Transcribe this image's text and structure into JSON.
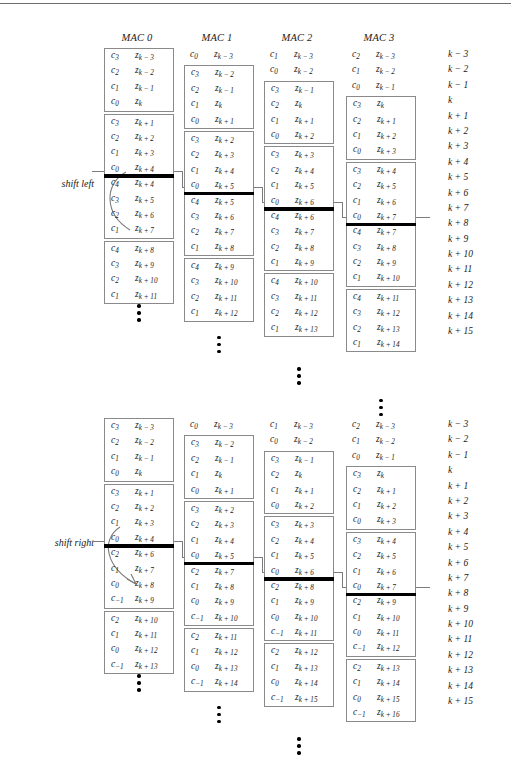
{
  "page": {
    "running_head": "",
    "rule_color": "#6d6d6d"
  },
  "headers": [
    {
      "label": "MAC 0"
    },
    {
      "label": "MAC 1"
    },
    {
      "label": "MAC 2"
    },
    {
      "label": "MAC 3"
    }
  ],
  "shift_left": {
    "label": "shift left",
    "index_column": [
      "k − 3",
      "k − 2",
      "k − 1",
      "k",
      "k + 1",
      "k + 2",
      "k + 3",
      "k + 4",
      "k + 5",
      "k + 6",
      "k + 7",
      "k + 8",
      "k + 9",
      "k + 10",
      "k + 11",
      "k + 12",
      "k + 13",
      "k + 14",
      "k + 15"
    ],
    "columns": [
      {
        "name": "MAC 0",
        "offset_rows": 0,
        "groups": [
          {
            "boxed": true,
            "rows": [
              {
                "c": "3",
                "z": "k − 3"
              },
              {
                "c": "2",
                "z": "k − 2"
              },
              {
                "c": "1",
                "z": "k − 1"
              },
              {
                "c": "0",
                "z": "k"
              }
            ]
          },
          {
            "boxed": true,
            "bar_after": 4,
            "rows": [
              {
                "c": "3",
                "z": "k + 1"
              },
              {
                "c": "2",
                "z": "k + 2"
              },
              {
                "c": "1",
                "z": "k + 3"
              },
              {
                "c": "0",
                "z": "k + 4"
              },
              {
                "c": "4",
                "z": "k + 4"
              },
              {
                "c": "3",
                "z": "k + 5"
              },
              {
                "c": "2",
                "z": "k + 6"
              },
              {
                "c": "1",
                "z": "k + 7"
              }
            ]
          },
          {
            "boxed": true,
            "rows": [
              {
                "c": "4",
                "z": "k + 8"
              },
              {
                "c": "3",
                "z": "k + 9"
              },
              {
                "c": "2",
                "z": "k + 10"
              },
              {
                "c": "1",
                "z": "k + 11"
              }
            ]
          }
        ]
      },
      {
        "name": "MAC 1",
        "offset_rows": 0,
        "groups": [
          {
            "boxed": false,
            "rows": [
              {
                "c": "0",
                "z": "k − 3"
              }
            ]
          },
          {
            "boxed": true,
            "rows": [
              {
                "c": "3",
                "z": "k − 2"
              },
              {
                "c": "2",
                "z": "k − 1"
              },
              {
                "c": "1",
                "z": "k"
              },
              {
                "c": "0",
                "z": "k + 1"
              }
            ]
          },
          {
            "boxed": true,
            "bar_after": 4,
            "rows": [
              {
                "c": "3",
                "z": "k + 2"
              },
              {
                "c": "2",
                "z": "k + 3"
              },
              {
                "c": "1",
                "z": "k + 4"
              },
              {
                "c": "0",
                "z": "k + 5"
              },
              {
                "c": "4",
                "z": "k + 5"
              },
              {
                "c": "3",
                "z": "k + 6"
              },
              {
                "c": "2",
                "z": "k + 7"
              },
              {
                "c": "1",
                "z": "k + 8"
              }
            ]
          },
          {
            "boxed": true,
            "rows": [
              {
                "c": "4",
                "z": "k + 9"
              },
              {
                "c": "3",
                "z": "k + 10"
              },
              {
                "c": "2",
                "z": "k + 11"
              },
              {
                "c": "1",
                "z": "k + 12"
              }
            ]
          }
        ]
      },
      {
        "name": "MAC 2",
        "offset_rows": 0,
        "groups": [
          {
            "boxed": false,
            "rows": [
              {
                "c": "1",
                "z": "k − 3"
              },
              {
                "c": "0",
                "z": "k − 2"
              }
            ]
          },
          {
            "boxed": true,
            "rows": [
              {
                "c": "3",
                "z": "k − 1"
              },
              {
                "c": "2",
                "z": "k"
              },
              {
                "c": "1",
                "z": "k + 1"
              },
              {
                "c": "0",
                "z": "k + 2"
              }
            ]
          },
          {
            "boxed": true,
            "bar_after": 4,
            "rows": [
              {
                "c": "3",
                "z": "k + 3"
              },
              {
                "c": "2",
                "z": "k + 4"
              },
              {
                "c": "1",
                "z": "k + 5"
              },
              {
                "c": "0",
                "z": "k + 6"
              },
              {
                "c": "4",
                "z": "k + 6"
              },
              {
                "c": "3",
                "z": "k + 7"
              },
              {
                "c": "2",
                "z": "k + 8"
              },
              {
                "c": "1",
                "z": "k + 9"
              }
            ]
          },
          {
            "boxed": true,
            "rows": [
              {
                "c": "4",
                "z": "k + 10"
              },
              {
                "c": "3",
                "z": "k + 11"
              },
              {
                "c": "2",
                "z": "k + 12"
              },
              {
                "c": "1",
                "z": "k + 13"
              }
            ]
          }
        ]
      },
      {
        "name": "MAC 3",
        "offset_rows": 0,
        "groups": [
          {
            "boxed": false,
            "rows": [
              {
                "c": "2",
                "z": "k − 3"
              },
              {
                "c": "1",
                "z": "k − 2"
              },
              {
                "c": "0",
                "z": "k − 1"
              }
            ]
          },
          {
            "boxed": true,
            "rows": [
              {
                "c": "3",
                "z": "k"
              },
              {
                "c": "2",
                "z": "k + 1"
              },
              {
                "c": "1",
                "z": "k + 2"
              },
              {
                "c": "0",
                "z": "k + 3"
              }
            ]
          },
          {
            "boxed": true,
            "bar_after": 4,
            "rows": [
              {
                "c": "3",
                "z": "k + 4"
              },
              {
                "c": "2",
                "z": "k + 5"
              },
              {
                "c": "1",
                "z": "k + 6"
              },
              {
                "c": "0",
                "z": "k + 7"
              },
              {
                "c": "4",
                "z": "k + 7"
              },
              {
                "c": "3",
                "z": "k + 8"
              },
              {
                "c": "2",
                "z": "k + 9"
              },
              {
                "c": "1",
                "z": "k + 10"
              }
            ]
          },
          {
            "boxed": true,
            "rows": [
              {
                "c": "4",
                "z": "k + 11"
              },
              {
                "c": "3",
                "z": "k + 12"
              },
              {
                "c": "2",
                "z": "k + 13"
              },
              {
                "c": "1",
                "z": "k + 14"
              }
            ]
          }
        ]
      }
    ]
  },
  "shift_right": {
    "label": "shift right",
    "index_column": [
      "k − 3",
      "k − 2",
      "k − 1",
      "k",
      "k + 1",
      "k + 2",
      "k + 3",
      "k + 4",
      "k + 5",
      "k + 6",
      "k + 7",
      "k + 8",
      "k + 9",
      "k + 10",
      "k + 11",
      "k + 12",
      "k + 13",
      "k + 14",
      "k + 15"
    ],
    "columns": [
      {
        "name": "MAC 0",
        "offset_rows": 0,
        "groups": [
          {
            "boxed": true,
            "rows": [
              {
                "c": "3",
                "z": "k − 3"
              },
              {
                "c": "2",
                "z": "k − 2"
              },
              {
                "c": "1",
                "z": "k − 1"
              },
              {
                "c": "0",
                "z": "k"
              }
            ]
          },
          {
            "boxed": true,
            "bar_after": 4,
            "rows": [
              {
                "c": "3",
                "z": "k + 1"
              },
              {
                "c": "2",
                "z": "k + 2"
              },
              {
                "c": "1",
                "z": "k + 3"
              },
              {
                "c": "0",
                "z": "k + 4"
              },
              {
                "c": "2",
                "z": "k + 6"
              },
              {
                "c": "1",
                "z": "k + 7"
              },
              {
                "c": "0",
                "z": "k + 8"
              },
              {
                "c": "−1",
                "z": "k + 9"
              }
            ]
          },
          {
            "boxed": true,
            "rows": [
              {
                "c": "2",
                "z": "k + 10"
              },
              {
                "c": "1",
                "z": "k + 11"
              },
              {
                "c": "0",
                "z": "k + 12"
              },
              {
                "c": "−1",
                "z": "k + 13"
              }
            ]
          }
        ]
      },
      {
        "name": "MAC 1",
        "offset_rows": 0,
        "groups": [
          {
            "boxed": false,
            "rows": [
              {
                "c": "0",
                "z": "k − 3"
              }
            ]
          },
          {
            "boxed": true,
            "rows": [
              {
                "c": "3",
                "z": "k − 2"
              },
              {
                "c": "2",
                "z": "k − 1"
              },
              {
                "c": "1",
                "z": "k"
              },
              {
                "c": "0",
                "z": "k + 1"
              }
            ]
          },
          {
            "boxed": true,
            "bar_after": 4,
            "rows": [
              {
                "c": "3",
                "z": "k + 2"
              },
              {
                "c": "2",
                "z": "k + 3"
              },
              {
                "c": "1",
                "z": "k + 4"
              },
              {
                "c": "0",
                "z": "k + 5"
              },
              {
                "c": "2",
                "z": "k + 7"
              },
              {
                "c": "1",
                "z": "k + 8"
              },
              {
                "c": "0",
                "z": "k + 9"
              },
              {
                "c": "−1",
                "z": "k + 10"
              }
            ]
          },
          {
            "boxed": true,
            "rows": [
              {
                "c": "2",
                "z": "k + 11"
              },
              {
                "c": "1",
                "z": "k + 12"
              },
              {
                "c": "0",
                "z": "k + 13"
              },
              {
                "c": "−1",
                "z": "k + 14"
              }
            ]
          }
        ]
      },
      {
        "name": "MAC 2",
        "offset_rows": 0,
        "groups": [
          {
            "boxed": false,
            "rows": [
              {
                "c": "1",
                "z": "k − 3"
              },
              {
                "c": "0",
                "z": "k − 2"
              }
            ]
          },
          {
            "boxed": true,
            "rows": [
              {
                "c": "3",
                "z": "k − 1"
              },
              {
                "c": "2",
                "z": "k"
              },
              {
                "c": "1",
                "z": "k + 1"
              },
              {
                "c": "0",
                "z": "k + 2"
              }
            ]
          },
          {
            "boxed": true,
            "bar_after": 4,
            "rows": [
              {
                "c": "3",
                "z": "k + 3"
              },
              {
                "c": "2",
                "z": "k + 4"
              },
              {
                "c": "1",
                "z": "k + 5"
              },
              {
                "c": "0",
                "z": "k + 6"
              },
              {
                "c": "2",
                "z": "k + 8"
              },
              {
                "c": "1",
                "z": "k + 9"
              },
              {
                "c": "0",
                "z": "k + 10"
              },
              {
                "c": "−1",
                "z": "k + 11"
              }
            ]
          },
          {
            "boxed": true,
            "rows": [
              {
                "c": "2",
                "z": "k + 12"
              },
              {
                "c": "1",
                "z": "k + 13"
              },
              {
                "c": "0",
                "z": "k + 14"
              },
              {
                "c": "−1",
                "z": "k + 15"
              }
            ]
          }
        ]
      },
      {
        "name": "MAC 3",
        "offset_rows": 0,
        "groups": [
          {
            "boxed": false,
            "rows": [
              {
                "c": "2",
                "z": "k − 3"
              },
              {
                "c": "1",
                "z": "k − 2"
              },
              {
                "c": "0",
                "z": "k − 1"
              }
            ]
          },
          {
            "boxed": true,
            "rows": [
              {
                "c": "3",
                "z": "k"
              },
              {
                "c": "2",
                "z": "k + 1"
              },
              {
                "c": "1",
                "z": "k + 2"
              },
              {
                "c": "0",
                "z": "k + 3"
              }
            ]
          },
          {
            "boxed": true,
            "bar_after": 4,
            "rows": [
              {
                "c": "3",
                "z": "k + 4"
              },
              {
                "c": "2",
                "z": "k + 5"
              },
              {
                "c": "1",
                "z": "k + 6"
              },
              {
                "c": "0",
                "z": "k + 7"
              },
              {
                "c": "2",
                "z": "k + 9"
              },
              {
                "c": "1",
                "z": "k + 10"
              },
              {
                "c": "0",
                "z": "k + 11"
              },
              {
                "c": "−1",
                "z": "k + 12"
              }
            ]
          },
          {
            "boxed": true,
            "rows": [
              {
                "c": "2",
                "z": "k + 13"
              },
              {
                "c": "1",
                "z": "k + 14"
              },
              {
                "c": "0",
                "z": "k + 15"
              },
              {
                "c": "−1",
                "z": "k + 16"
              }
            ]
          }
        ]
      }
    ]
  },
  "layout": {
    "column_x": [
      104,
      184,
      264,
      346
    ],
    "index_x": 448,
    "row_height": 15.4,
    "column_top_offsets": [
      0,
      0,
      0,
      0
    ],
    "ellipsis_extra_offset": [
      10,
      26,
      42,
      58
    ]
  }
}
